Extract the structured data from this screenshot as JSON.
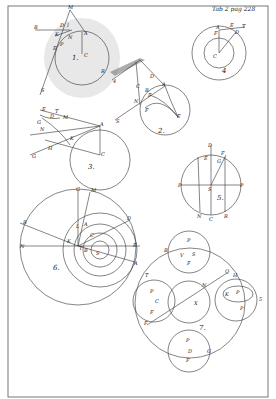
{
  "plate": {
    "header": "Tab 2 pag 228",
    "background": "#ffffff",
    "ink": "#333333"
  },
  "figures": [
    {
      "number": "1.",
      "labels": [
        "M",
        "B",
        "D",
        "I",
        "K",
        "N",
        "A",
        "E",
        "P",
        "C",
        "R",
        "S"
      ]
    },
    {
      "number": "2.",
      "labels": [
        "D",
        "A",
        "C",
        "B",
        "F",
        "N",
        "F",
        "E",
        "S",
        "4"
      ]
    },
    {
      "number": "3.",
      "labels": [
        "E",
        "T",
        "D",
        "M",
        "G",
        "N",
        "K",
        "H",
        "G",
        "A",
        "C"
      ]
    },
    {
      "number": "4",
      "labels": [
        "A",
        "E",
        "T",
        "D",
        "F",
        "C"
      ]
    },
    {
      "number": "5.",
      "labels": [
        "D",
        "E",
        "F",
        "G",
        "P",
        "S",
        "P",
        "N",
        "C",
        "R"
      ]
    },
    {
      "number": "6.",
      "labels": [
        "G",
        "M",
        "R",
        "N",
        "L",
        "A",
        "D",
        "K",
        "T",
        "B",
        "S",
        "E"
      ]
    },
    {
      "number": "7.",
      "labels": [
        "P",
        "B",
        "V",
        "S",
        "F",
        "T",
        "Q",
        "H",
        "N",
        "C",
        "P",
        "F",
        "X",
        "K",
        "F",
        "P",
        "D",
        "G",
        "5"
      ]
    }
  ]
}
